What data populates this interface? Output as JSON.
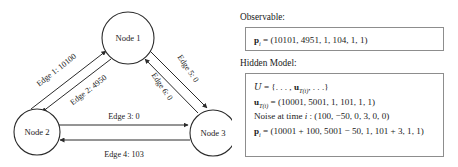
{
  "graph": {
    "nodes": [
      {
        "id": "node-1",
        "label": "Node 1",
        "cx": 128,
        "cy": 38,
        "r": 26
      },
      {
        "id": "node-2",
        "label": "Node 2",
        "cx": 37,
        "cy": 132,
        "r": 23
      },
      {
        "id": "node-3",
        "label": "Node 3",
        "cx": 213,
        "cy": 133,
        "r": 23
      }
    ],
    "edges": [
      {
        "id": "edge-1",
        "label": "Edge 1: 10100",
        "from": "node-2",
        "to": "node-1",
        "value": 10100
      },
      {
        "id": "edge-2",
        "label": "Edge 2: 4950",
        "from": "node-1",
        "to": "node-2",
        "value": 4950
      },
      {
        "id": "edge-3",
        "label": "Edge 3: 0",
        "from": "node-2",
        "to": "node-3",
        "value": 0
      },
      {
        "id": "edge-4",
        "label": "Edge 4: 103",
        "from": "node-3",
        "to": "node-2",
        "value": 103
      },
      {
        "id": "edge-5",
        "label": "Edge 5: 0",
        "from": "node-1",
        "to": "node-3",
        "value": 0
      },
      {
        "id": "edge-6",
        "label": "Edge 6: 0",
        "from": "node-3",
        "to": "node-1",
        "value": 0
      }
    ]
  },
  "observable": {
    "heading": "Observable:",
    "equation_lhs": "p",
    "equation_sub": "i",
    "equation_rhs": " = (10101, 4951, 1, 104, 1, 1)"
  },
  "hidden_model": {
    "heading": "Hidden Model:",
    "lines": [
      {
        "id": "set-definition",
        "lhs": "U",
        "lhs_style": "script",
        "rhs": " = {. . . , ",
        "mid_bf": "u",
        "mid_sub": "T(i)",
        "tail": ", . . .}"
      },
      {
        "id": "hidden-vector",
        "lhs": "u",
        "lhs_style": "bold",
        "lhs_sub": "T(i)",
        "rhs": " = (10001, 5001, 1, 101, 1, 1)"
      },
      {
        "id": "noise-line",
        "text_prefix": "Noise at time ",
        "text_italic": "i",
        "text_suffix": " : (100, −50, 0, 3, 0, 0)"
      },
      {
        "id": "observed-vector",
        "lhs": "p",
        "lhs_style": "bold",
        "lhs_sub": "i",
        "rhs": " = (10001 + 100, 5001 − 50, 1, 101 + 3, 1, 1)"
      }
    ]
  },
  "colors": {
    "stroke": "#2b2b2b",
    "box_border": "#8d8d8d",
    "text": "#1a1a1a",
    "background": "#ffffff"
  }
}
